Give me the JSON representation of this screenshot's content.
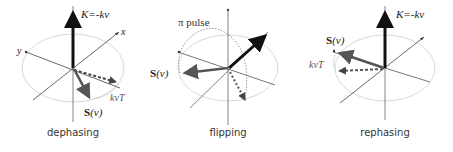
{
  "colors": {
    "axis": "#555555",
    "ellipse": "#cfcfcf",
    "k_vector": "#111111",
    "s_vector": "#555555",
    "dashed_vector": "#444444",
    "arc": "#8a8a8a",
    "text": "#222222"
  },
  "panels": [
    {
      "caption": "dephasing",
      "k_label": "K=-kv",
      "x_axis_label": "x",
      "y_axis_label": "y",
      "s_label_bold": "S",
      "s_label_arg": "(v)",
      "phase_label": "kvT"
    },
    {
      "caption": "flipping",
      "pulse_label": "π pulse",
      "s_label_bold": "S",
      "s_label_arg": "(v)"
    },
    {
      "caption": "rephasing",
      "k_label": "K=-kv",
      "s_label_bold": "S",
      "s_label_arg": "(v)",
      "phase_label": "kvT"
    }
  ]
}
